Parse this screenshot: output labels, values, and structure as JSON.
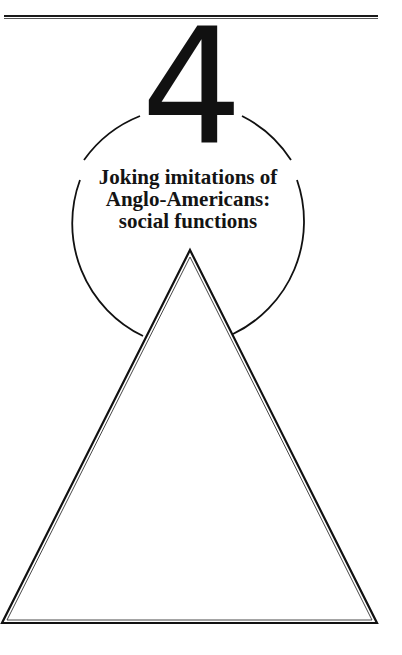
{
  "chapter": {
    "number": "4",
    "title_lines": [
      "Joking imitations of",
      "Anglo-Americans:",
      "social functions"
    ]
  },
  "colors": {
    "ink": "#111111",
    "paper": "#ffffff"
  }
}
